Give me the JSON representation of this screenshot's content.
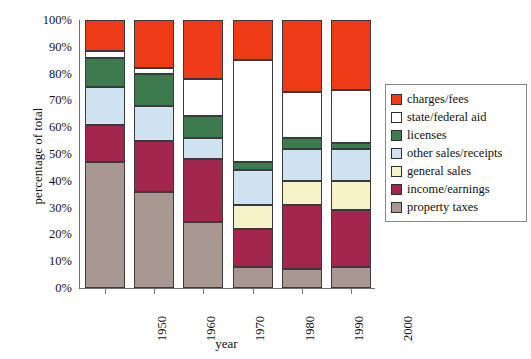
{
  "chart_data": {
    "type": "bar",
    "subtype": "stacked-percentage",
    "title": "",
    "xlabel": "year",
    "ylabel": "percentage of total",
    "categories": [
      "1950",
      "1960",
      "1970",
      "1980",
      "1990",
      "2000"
    ],
    "ylim": [
      0,
      100
    ],
    "y_ticks": [
      "0%",
      "10%",
      "20%",
      "30%",
      "40%",
      "50%",
      "60%",
      "70%",
      "80%",
      "90%",
      "100%"
    ],
    "y_tick_values": [
      0,
      10,
      20,
      30,
      40,
      50,
      60,
      70,
      80,
      90,
      100
    ],
    "grid": false,
    "legend_position": "right",
    "stack_order_bottom_to_top": [
      "property taxes",
      "income/earnings",
      "general sales",
      "other sales/receipts",
      "licenses",
      "state/federal aid",
      "charges/fees"
    ],
    "series": [
      {
        "name": "property taxes",
        "color": "#a99791",
        "values": [
          47,
          36,
          24.5,
          8,
          7,
          8
        ]
      },
      {
        "name": "income/earnings",
        "color": "#a3264e",
        "values": [
          14,
          19,
          23.5,
          14,
          24,
          21
        ]
      },
      {
        "name": "general sales",
        "color": "#f7f3c8",
        "values": [
          0,
          0,
          0,
          9,
          9,
          11
        ]
      },
      {
        "name": "other sales/receipts",
        "color": "#cfe2f2",
        "values": [
          14,
          13,
          8,
          13,
          12,
          12
        ]
      },
      {
        "name": "licenses",
        "color": "#3d7a4e",
        "values": [
          11,
          12,
          8,
          3,
          4,
          2
        ]
      },
      {
        "name": "state/federal aid",
        "color": "#ffffff",
        "values": [
          2.5,
          2,
          14,
          38,
          17,
          20
        ]
      },
      {
        "name": "charges/fees",
        "color": "#f03b18",
        "values": [
          11.5,
          18,
          22,
          15,
          27,
          26
        ]
      }
    ],
    "cumulative_tops": {
      "1950": [
        47,
        61,
        61,
        75,
        86,
        88.5,
        100
      ],
      "1960": [
        36,
        55,
        55,
        68,
        80,
        82,
        100
      ],
      "1970": [
        24.5,
        48,
        48,
        56,
        64,
        78,
        100
      ],
      "1980": [
        8,
        22,
        31,
        44,
        47,
        85,
        100
      ],
      "1990": [
        7,
        31,
        40,
        52,
        56,
        73,
        100
      ],
      "2000": [
        8,
        29,
        40,
        52,
        54,
        74,
        100
      ]
    }
  },
  "legend": {
    "items": [
      {
        "label": "charges/fees",
        "color": "#f03b18"
      },
      {
        "label": "state/federal aid",
        "color": "#ffffff"
      },
      {
        "label": "licenses",
        "color": "#3d7a4e"
      },
      {
        "label": "other sales/receipts",
        "color": "#cfe2f2"
      },
      {
        "label": "general sales",
        "color": "#f7f3c8"
      },
      {
        "label": "income/earnings",
        "color": "#a3264e"
      },
      {
        "label": "property taxes",
        "color": "#a99791"
      }
    ]
  }
}
